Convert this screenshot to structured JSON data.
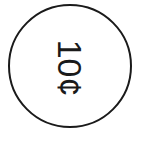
{
  "coin": {
    "label": "10¢",
    "stroke_color": "#1a1a1a"
  }
}
